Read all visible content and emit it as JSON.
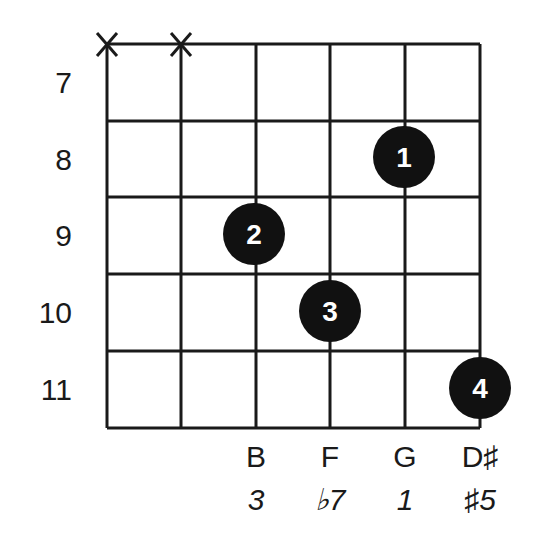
{
  "diagram": {
    "type": "guitar-chord-diagram",
    "strings": 6,
    "frets": {
      "labels": [
        "7",
        "8",
        "9",
        "10",
        "11"
      ]
    },
    "muted_strings": [
      1,
      2
    ],
    "muted_symbol": "X",
    "fingers": [
      {
        "finger": "1",
        "string": 5,
        "fret": "8"
      },
      {
        "finger": "2",
        "string": 3,
        "fret": "9"
      },
      {
        "finger": "3",
        "string": 4,
        "fret": "10"
      },
      {
        "finger": "4",
        "string": 6,
        "fret": "11"
      }
    ],
    "notes": [
      {
        "string": 3,
        "note": "B",
        "degree": "3"
      },
      {
        "string": 4,
        "note": "F",
        "degree": "♭7"
      },
      {
        "string": 5,
        "note": "G",
        "degree": "1"
      },
      {
        "string": 6,
        "note": "D♯",
        "degree": "♯5"
      }
    ],
    "colors": {
      "line": "#1a1a1a",
      "dot": "#111111",
      "dot_text": "#ffffff",
      "background": "#ffffff"
    }
  }
}
